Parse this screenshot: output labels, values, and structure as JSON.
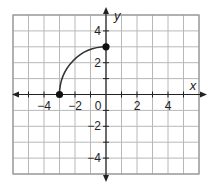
{
  "chart_data": {
    "type": "line",
    "title": "",
    "xlabel": "x",
    "ylabel": "y",
    "xlim": [
      -6,
      6
    ],
    "ylim": [
      -5,
      5
    ],
    "grid": true,
    "x_ticks": [
      -4,
      -2,
      0,
      2,
      4
    ],
    "y_ticks": [
      4,
      2,
      -2,
      -4
    ],
    "x_tick_labels": [
      "−4",
      "−2",
      "0",
      "2",
      "4"
    ],
    "y_tick_labels": [
      "4",
      "2",
      "−2",
      "−4"
    ],
    "series": [
      {
        "name": "quarter-circle curve",
        "description": "Curve from (-3, 0) rising to (0, 3), closed endpoints",
        "points": [
          [
            -3,
            0
          ],
          [
            -2.6,
            1.5
          ],
          [
            -2,
            2.24
          ],
          [
            -1,
            2.83
          ],
          [
            0,
            3
          ]
        ],
        "endpoints": [
          [
            -3,
            0
          ],
          [
            0,
            3
          ]
        ],
        "endpoint_style": "closed"
      }
    ],
    "colors": {
      "grid": "#b8b8b8",
      "axis": "#222222",
      "curve": "#333333"
    }
  }
}
